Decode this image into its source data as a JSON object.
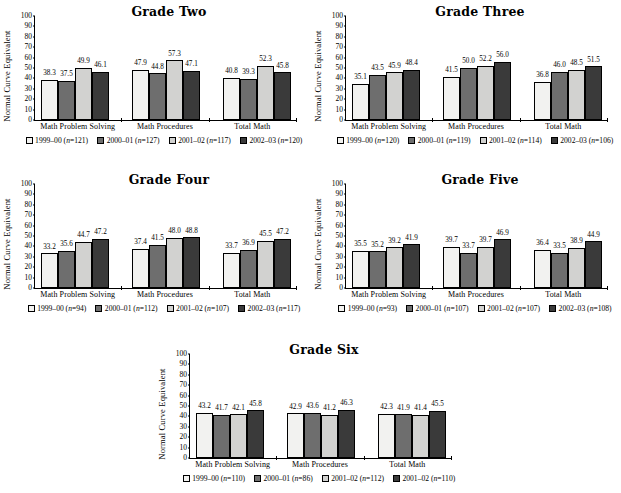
{
  "figure": {
    "axis": {
      "ylabel": "Normal Curve Equivalent",
      "yticks": [
        "0",
        "10",
        "20",
        "30",
        "40",
        "50",
        "60",
        "70",
        "80",
        "90",
        "100"
      ],
      "ymin": 0,
      "ymax": 100
    },
    "categories": [
      "Math Problem Solving",
      "Math Procedures",
      "Total Math"
    ],
    "colors": {
      "series0": "#f2f2f0",
      "series1": "#6e6e6e",
      "series2": "#d2d2d0",
      "series3": "#3a3a3a",
      "axis": "#000000",
      "background": "#ffffff"
    }
  },
  "chart_data": [
    {
      "type": "bar",
      "title": "Grade Two",
      "xlabel": "",
      "ylabel": "Normal Curve Equivalent",
      "ylim": [
        0,
        100
      ],
      "grid": false,
      "legend_position": "bottom",
      "categories": [
        "Math Problem Solving",
        "Math Procedures",
        "Total Math"
      ],
      "series": [
        {
          "name": "1999-00",
          "n": 121,
          "legend": "1999–00 (n=121)",
          "values": [
            38.3,
            47.9,
            40.8
          ]
        },
        {
          "name": "2000-01",
          "n": 127,
          "legend": "2000–01 (n=127)",
          "values": [
            37.5,
            44.8,
            39.3
          ]
        },
        {
          "name": "2001-02",
          "n": 117,
          "legend": "2001–02 (n=117)",
          "values": [
            49.9,
            57.3,
            52.3
          ]
        },
        {
          "name": "2002-03",
          "n": 120,
          "legend": "2002–03 (n=120)",
          "values": [
            46.1,
            47.1,
            45.8
          ]
        }
      ]
    },
    {
      "type": "bar",
      "title": "Grade Three",
      "xlabel": "",
      "ylabel": "Normal Curve Equivalent",
      "ylim": [
        0,
        100
      ],
      "grid": false,
      "legend_position": "bottom",
      "categories": [
        "Math Problem Solving",
        "Math Procedures",
        "Total Math"
      ],
      "series": [
        {
          "name": "1999-00",
          "n": 120,
          "legend": "1999–00 (n=120)",
          "values": [
            35.1,
            41.5,
            36.8
          ]
        },
        {
          "name": "2000-01",
          "n": 119,
          "legend": "2000–01 (n=119)",
          "values": [
            43.5,
            50.0,
            46.0
          ]
        },
        {
          "name": "2001-02",
          "n": 114,
          "legend": "2001–02 (n=114)",
          "values": [
            45.9,
            52.2,
            48.5
          ]
        },
        {
          "name": "2002-03",
          "n": 106,
          "legend": "2002–03 (n=106)",
          "values": [
            48.4,
            56.0,
            51.5
          ]
        }
      ]
    },
    {
      "type": "bar",
      "title": "Grade Four",
      "xlabel": "",
      "ylabel": "Normal Curve Equivalent",
      "ylim": [
        0,
        100
      ],
      "grid": false,
      "legend_position": "bottom",
      "categories": [
        "Math Problem Solving",
        "Math Procedures",
        "Total Math"
      ],
      "series": [
        {
          "name": "1999-00",
          "n": 94,
          "legend": "1999–00 (n=94)",
          "values": [
            33.2,
            37.4,
            33.7
          ]
        },
        {
          "name": "2000-01",
          "n": 112,
          "legend": "2000–01 (n=112)",
          "values": [
            35.6,
            41.5,
            36.9
          ]
        },
        {
          "name": "2001-02",
          "n": 107,
          "legend": "2001–02 (n=107)",
          "values": [
            44.7,
            48.0,
            45.5
          ]
        },
        {
          "name": "2002-03",
          "n": 117,
          "legend": "2002–03 (n=117)",
          "values": [
            47.2,
            48.8,
            47.2
          ]
        }
      ]
    },
    {
      "type": "bar",
      "title": "Grade Five",
      "xlabel": "",
      "ylabel": "Normal Curve Equivalent",
      "ylim": [
        0,
        100
      ],
      "grid": false,
      "legend_position": "bottom",
      "categories": [
        "Math Problem Solving",
        "Math Procedures",
        "Total Math"
      ],
      "series": [
        {
          "name": "1999-00",
          "n": 93,
          "legend": "1999–00 (n=93)",
          "values": [
            35.5,
            39.7,
            36.4
          ]
        },
        {
          "name": "2000-01",
          "n": 107,
          "legend": "2000–01 (n=107)",
          "values": [
            35.2,
            33.7,
            33.5
          ]
        },
        {
          "name": "2001-02",
          "n": 107,
          "legend": "2001–02 (n=107)",
          "values": [
            39.2,
            39.7,
            38.9
          ]
        },
        {
          "name": "2002-03",
          "n": 108,
          "legend": "2002–03 (n=108)",
          "values": [
            41.9,
            46.9,
            44.9
          ]
        }
      ]
    },
    {
      "type": "bar",
      "title": "Grade Six",
      "xlabel": "",
      "ylabel": "Normal Curve Equivalent",
      "ylim": [
        0,
        100
      ],
      "grid": false,
      "legend_position": "bottom",
      "categories": [
        "Math Problem Solving",
        "Math Procedures",
        "Total Math"
      ],
      "series": [
        {
          "name": "1999-00",
          "n": 110,
          "legend": "1999–00 (n=110)",
          "values": [
            43.2,
            42.9,
            42.3
          ]
        },
        {
          "name": "2000-01",
          "n": 86,
          "legend": "2000–01 (n=86)",
          "values": [
            41.7,
            43.6,
            41.9
          ]
        },
        {
          "name": "2001-02",
          "n": 112,
          "legend": "2001–02 (n=112)",
          "values": [
            42.1,
            41.2,
            41.4
          ]
        },
        {
          "name": "2001-02",
          "n": 110,
          "legend": "2001–02 (n=110)",
          "values": [
            45.8,
            46.3,
            45.5
          ]
        }
      ]
    }
  ]
}
